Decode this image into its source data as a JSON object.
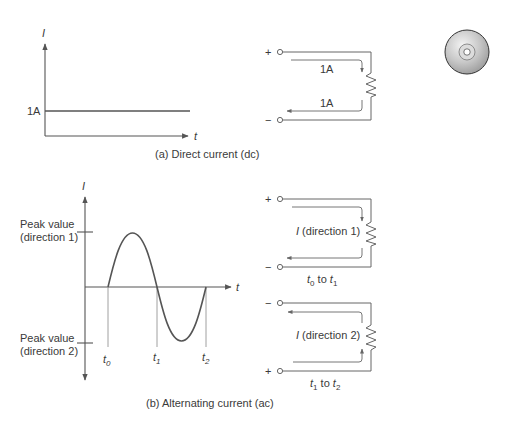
{
  "panel_dc": {
    "y_axis_label": "I",
    "x_axis_label": "t",
    "level_label": "1A",
    "caption": "(a)  Direct current (dc)",
    "circuit": {
      "plus": "+",
      "minus": "−",
      "top_current": "1A",
      "bottom_current": "1A"
    }
  },
  "panel_ac": {
    "y_axis_label": "I",
    "x_axis_label": "t",
    "peak1_line1": "Peak value",
    "peak1_line2": "(direction 1)",
    "peak2_line1": "Peak value",
    "peak2_line2": "(direction 2)",
    "t0": "t",
    "t0_sub": "0",
    "t1": "t",
    "t1_sub": "1",
    "t2": "t",
    "t2_sub": "2",
    "caption": "(b)  Alternating current (ac)",
    "circuit1": {
      "plus": "+",
      "minus": "−",
      "current_I": "I",
      "current_dir": " (direction 1)",
      "interval_a": "t",
      "interval_a_sub": "0",
      "interval_to": " to ",
      "interval_b": "t",
      "interval_b_sub": "1"
    },
    "circuit2": {
      "plus": "+",
      "minus": "−",
      "current_I": "I",
      "current_dir": " (direction 2)",
      "interval_a": "t",
      "interval_a_sub": "1",
      "interval_to": " to ",
      "interval_b": "t",
      "interval_b_sub": "2"
    }
  },
  "icons": {
    "cd": "cd-disc-icon"
  },
  "colors": {
    "line": "#555555",
    "text": "#3a3a3a",
    "background": "#ffffff"
  }
}
